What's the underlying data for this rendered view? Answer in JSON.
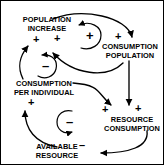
{
  "diagram": {
    "type": "causal-loop-diagram",
    "background_color": "#ffffff",
    "stroke_color": "#000000",
    "nodes": [
      {
        "id": "population-increase",
        "lines": [
          "POPULATION",
          "INCREASE"
        ]
      },
      {
        "id": "consumption-population",
        "lines": [
          "CONSUMPTION",
          "POPULATION"
        ]
      },
      {
        "id": "consumption-per-individual",
        "lines": [
          "CONSUMPTION",
          "PER INDIVIDUAL"
        ]
      },
      {
        "id": "resource-consumption",
        "lines": [
          "RESOURCE",
          "CONSUMPTION"
        ]
      },
      {
        "id": "available-resource",
        "lines": [
          "AVAILABLE",
          "RESOURCE"
        ]
      }
    ],
    "link_signs": [
      {
        "id": "sign-pop-increase-left",
        "value": "+"
      },
      {
        "id": "sign-pop-increase-right",
        "value": "+"
      },
      {
        "id": "sign-consumption-population",
        "value": "+"
      },
      {
        "id": "sign-resource-consumption-left",
        "value": "+"
      },
      {
        "id": "sign-resource-consumption-right",
        "value": "+"
      },
      {
        "id": "sign-consumption-per-individual",
        "value": "+"
      },
      {
        "id": "sign-available-resource",
        "value": "–"
      }
    ],
    "loop_markers": [
      {
        "id": "loop-reinforcing-top",
        "value": "+",
        "polarity": "reinforcing"
      },
      {
        "id": "loop-balancing-left",
        "value": "–",
        "polarity": "balancing"
      },
      {
        "id": "loop-balancing-bottom",
        "value": "–",
        "polarity": "balancing"
      }
    ]
  }
}
